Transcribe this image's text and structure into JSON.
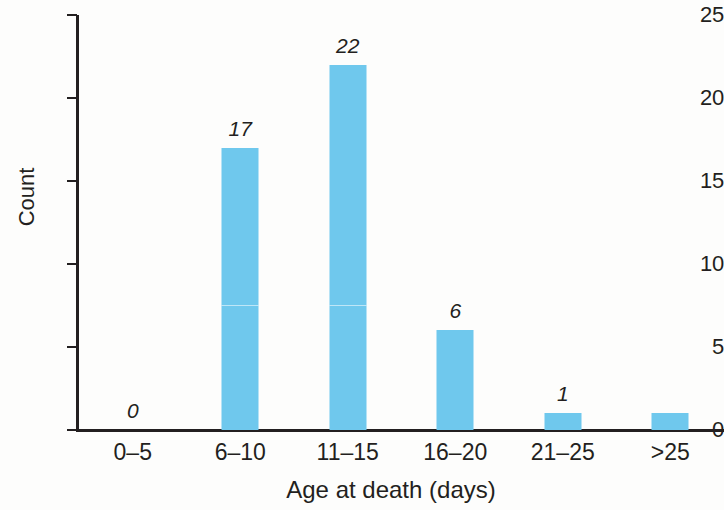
{
  "chart_data": {
    "type": "bar",
    "title": "",
    "xlabel": "Age at death (days)",
    "ylabel": "Count",
    "categories": [
      "0–5",
      "6–10",
      "11–15",
      "16–20",
      "21–25",
      ">25"
    ],
    "values": [
      0,
      17,
      22,
      6,
      1,
      1
    ],
    "point_labels": [
      "0",
      "17",
      "22",
      "6",
      "1",
      ""
    ],
    "ylim": [
      0,
      25
    ],
    "y_ticks": [
      0,
      5,
      10,
      15,
      20,
      25
    ],
    "y_tick_labels": [
      "0",
      "5",
      "10",
      "15",
      "20",
      "25"
    ],
    "grid": false,
    "legend": false,
    "bar_color": "#6fc8ed",
    "axis_color": "#231f20",
    "label_style": "italic"
  },
  "axes": {
    "y_title": "Count",
    "x_title": "Age at death (days)"
  }
}
